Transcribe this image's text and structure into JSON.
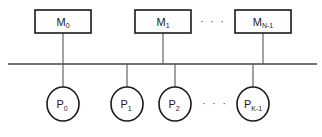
{
  "diagram": {
    "type": "shared-bus-architecture",
    "bus": {
      "x1": 8,
      "x2": 317,
      "y": 64
    },
    "memories": [
      {
        "base": "M",
        "sub": "0",
        "x": 35,
        "cx": 63
      },
      {
        "base": "M",
        "sub": "1",
        "x": 135,
        "cx": 163
      },
      {
        "base": "M",
        "sub": "N-1",
        "x": 235,
        "cx": 263
      }
    ],
    "memory_ellipsis": "· · ·",
    "processors": [
      {
        "base": "P",
        "sub": "0",
        "cx": 63
      },
      {
        "base": "P",
        "sub": "1",
        "cx": 127
      },
      {
        "base": "P",
        "sub": "2",
        "cx": 175
      },
      {
        "base": "P",
        "sub": "K-1",
        "cx": 253
      }
    ],
    "processor_ellipsis": "· · ·",
    "colors": {
      "stroke": "#1a1a1a",
      "bus": "#444444",
      "background": "#ffffff"
    }
  }
}
